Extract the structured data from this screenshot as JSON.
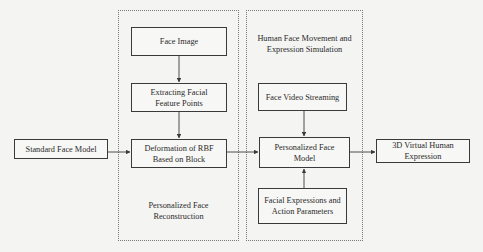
{
  "diagram": {
    "groups": {
      "reconstruction": {
        "label": "Personalized Face\nReconstruction"
      },
      "simulation": {
        "label": "Human Face Movement and\nExpression Simulation"
      }
    },
    "nodes": {
      "standard_face_model": "Standard Face Model",
      "face_image": "Face Image",
      "extracting_points": "Extracting Facial\nFeature Points",
      "deformation_rbf": "Deformation of RBF\nBased on Block",
      "face_video": "Face Video Streaming",
      "personalized_model": "Personalized Face\nModel",
      "facial_expressions": "Facial Expressions and\nAction Parameters",
      "virtual_expression": "3D Virtual Human\nExpression"
    },
    "edges": [
      {
        "from": "face_image",
        "to": "extracting_points"
      },
      {
        "from": "extracting_points",
        "to": "deformation_rbf"
      },
      {
        "from": "standard_face_model",
        "to": "deformation_rbf"
      },
      {
        "from": "deformation_rbf",
        "to": "personalized_model"
      },
      {
        "from": "face_video",
        "to": "personalized_model"
      },
      {
        "from": "facial_expressions",
        "to": "personalized_model"
      },
      {
        "from": "personalized_model",
        "to": "virtual_expression"
      }
    ],
    "colors": {
      "stroke": "#3a3a3a",
      "container_border": "#7a7a7a",
      "background": "#f4f4f2"
    }
  }
}
